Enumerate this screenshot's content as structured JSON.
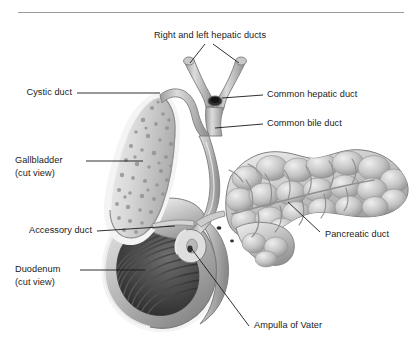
{
  "figure": {
    "type": "anatomical-illustration",
    "view": "cut view of gallbladder and duodenum",
    "background_color": "#ffffff",
    "rule_color": "#9a9a9a"
  },
  "palette": {
    "ink": "#1a1a1a",
    "leader_line": "#1a1a1a",
    "organ_light": "#e2e2e2",
    "organ_mid": "#b4b4b4",
    "organ_shadow": "#6e6e6e",
    "organ_dark": "#4a4a4a",
    "duodenum_lumen": "#3a3a3a",
    "outline": "#8c8c8c",
    "halo": "#f2f2f2"
  },
  "labels": {
    "hepatic_ducts": "Right and left hepatic ducts",
    "cystic_duct": "Cystic duct",
    "common_hepatic_duct": "Common hepatic duct",
    "common_bile_duct": "Common bile duct",
    "gallbladder": "Gallbladder",
    "gallbladder_note": "(cut view)",
    "accessory_duct": "Accessory duct",
    "duodenum": "Duodenum",
    "duodenum_note": "(cut view)",
    "pancreatic_duct": "Pancreatic duct",
    "ampulla_of_vater": "Ampulla of Vater"
  },
  "structures": [
    {
      "name": "right-and-left-hepatic-ducts",
      "label": "Right and left hepatic ducts",
      "side": "top",
      "leader": "forked"
    },
    {
      "name": "cystic-duct",
      "label": "Cystic duct",
      "side": "left",
      "leader": "straight"
    },
    {
      "name": "common-hepatic-duct",
      "label": "Common hepatic duct",
      "side": "right",
      "leader": "straight"
    },
    {
      "name": "common-bile-duct",
      "label": "Common bile duct",
      "side": "right",
      "leader": "straight"
    },
    {
      "name": "gallbladder",
      "label": "Gallbladder (cut view)",
      "side": "left",
      "leader": "straight"
    },
    {
      "name": "accessory-duct",
      "label": "Accessory duct",
      "side": "left",
      "leader": "straight"
    },
    {
      "name": "duodenum",
      "label": "Duodenum (cut view)",
      "side": "left",
      "leader": "straight"
    },
    {
      "name": "pancreatic-duct",
      "label": "Pancreatic duct",
      "side": "right",
      "leader": "diagonal"
    },
    {
      "name": "ampulla-of-vater",
      "label": "Ampulla of Vater",
      "side": "bottom",
      "leader": "diagonal"
    }
  ]
}
